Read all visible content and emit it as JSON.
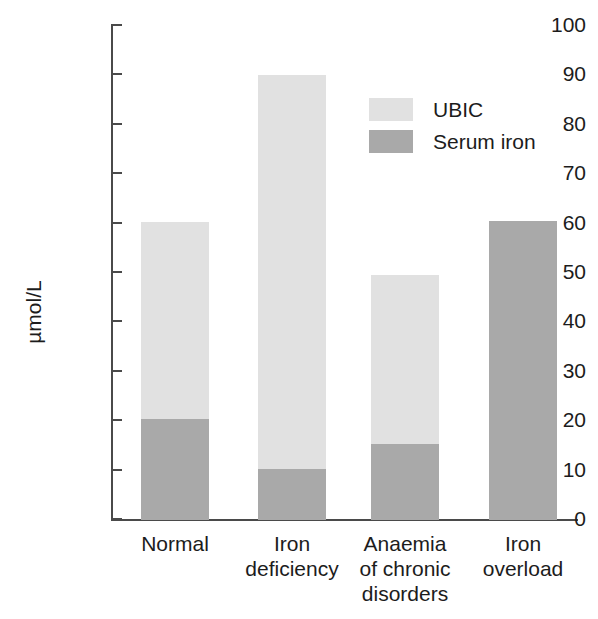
{
  "chart_data": {
    "type": "bar",
    "subtype": "stacked-bar",
    "title": "",
    "xlabel": "",
    "ylabel": "µmol/L",
    "ylim": [
      0,
      100
    ],
    "ytick_interval": 10,
    "yticks": [
      0,
      10,
      20,
      30,
      40,
      50,
      60,
      70,
      80,
      90,
      100
    ],
    "ytick_labels": [
      "0",
      "10",
      "20",
      "30",
      "40",
      "50",
      "60",
      "70",
      "80",
      "90",
      "100"
    ],
    "grid": false,
    "legend_position": "upper-right-inside",
    "categories": [
      "Normal",
      "Iron deficiency",
      "Anaemia of chronic disorders",
      "Iron overload"
    ],
    "category_label_lines": [
      [
        "Normal"
      ],
      [
        "Iron",
        "deficiency"
      ],
      [
        "Anaemia",
        "of chronic",
        "disorders"
      ],
      [
        "Iron",
        "overload"
      ]
    ],
    "series": [
      {
        "name": "Serum iron",
        "color": "#a9a9a9",
        "values": [
          20.5,
          10.3,
          15.4,
          60.5
        ]
      },
      {
        "name": "UBIC",
        "color": "#e1e1e1",
        "values": [
          39.8,
          79.7,
          34.1,
          0
        ]
      }
    ],
    "totals": [
      60.3,
      90.0,
      49.5,
      60.5
    ],
    "stack_order_bottom_to_top": [
      "Serum iron",
      "UBIC"
    ]
  },
  "legend": {
    "items": [
      {
        "label": "UBIC",
        "color": "#e1e1e1"
      },
      {
        "label": "Serum iron",
        "color": "#a9a9a9"
      }
    ]
  },
  "axis": {
    "y_title": "µmol/L",
    "y_labels": [
      "100",
      "90",
      "80",
      "70",
      "60",
      "50",
      "40",
      "30",
      "20",
      "10",
      "0"
    ],
    "axis_color": "#4a4a4a"
  }
}
